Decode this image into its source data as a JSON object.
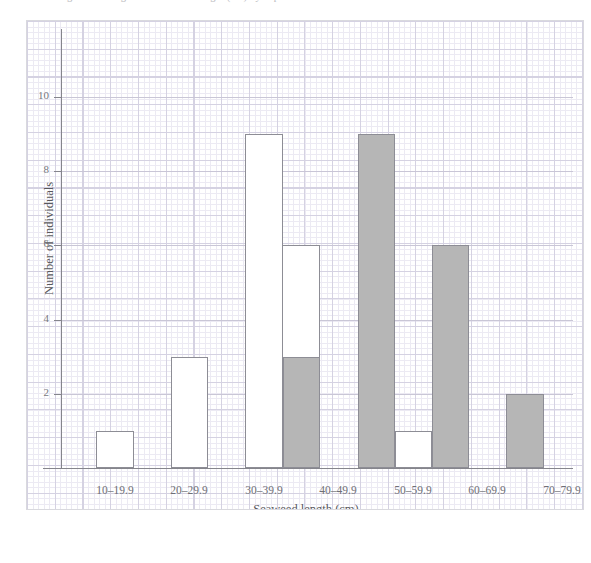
{
  "caption": {
    "text": "Figure 1  Histogram of seaweed length (cm) by exposure"
  },
  "chart_data": {
    "type": "bar",
    "title": "",
    "xlabel": "Seaweed length (cm)",
    "ylabel": "Number of individuals",
    "categories": [
      "10–19.9",
      "20–29.9",
      "30–39.9",
      "40–49.9",
      "50–59.9",
      "60–69.9",
      "70–79.9"
    ],
    "ylim": [
      0,
      11
    ],
    "ytick_labels": [
      "2",
      "4",
      "6",
      "8",
      "10"
    ],
    "ytick_values": [
      2,
      4,
      6,
      8,
      10
    ],
    "grid": true,
    "legend_position": "none",
    "series": [
      {
        "name": "open-bars",
        "style": "open",
        "fill_color": "#ffffff",
        "edge_color": "#8d8d95",
        "values": [
          1,
          3,
          9,
          6,
          1,
          0,
          0
        ]
      },
      {
        "name": "filled-bars",
        "style": "filled",
        "fill_color": "#b6b6b6",
        "edge_color": "#8d8d95",
        "values": [
          0,
          0,
          0,
          3,
          9,
          6,
          2
        ]
      }
    ],
    "bars": [
      {
        "category": "10–19.9",
        "value": 1,
        "style": "open",
        "x0": 69,
        "x1": 107
      },
      {
        "category": "20–29.9",
        "value": 3,
        "style": "open",
        "x0": 144,
        "x1": 181
      },
      {
        "category": "30–39.9",
        "value": 9,
        "style": "open",
        "x0": 218,
        "x1": 256
      },
      {
        "category": "40–49.9",
        "value": 6,
        "style": "open",
        "x0": 255,
        "x1": 293
      },
      {
        "category": "40–49.9",
        "value": 3,
        "style": "filled",
        "x0": 256,
        "x1": 293
      },
      {
        "category": "50–59.9",
        "value": 9,
        "style": "filled",
        "x0": 331,
        "x1": 368
      },
      {
        "category": "50–59.9",
        "value": 1,
        "style": "open",
        "x0": 368,
        "x1": 405
      },
      {
        "category": "60–69.9",
        "value": 6,
        "style": "filled",
        "x0": 405,
        "x1": 442
      },
      {
        "category": "70–79.9",
        "value": 2,
        "style": "filled",
        "x0": 479,
        "x1": 517
      }
    ],
    "tick_positions": [
      {
        "label": "10–19.9",
        "x": 88
      },
      {
        "label": "20–29.9",
        "x": 162
      },
      {
        "label": "30–39.9",
        "x": 237
      },
      {
        "label": "40–49.9",
        "x": 311
      },
      {
        "label": "50–59.9",
        "x": 386
      },
      {
        "label": "60–69.9",
        "x": 460
      },
      {
        "label": "70–79.9",
        "x": 535
      }
    ]
  }
}
